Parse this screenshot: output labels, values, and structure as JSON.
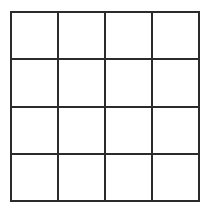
{
  "grid": {
    "rows": 4,
    "columns": 4,
    "line_color": "#2b2b2b",
    "background_color": "#ffffff",
    "cells": [
      [
        "",
        "",
        "",
        ""
      ],
      [
        "",
        "",
        "",
        ""
      ],
      [
        "",
        "",
        "",
        ""
      ],
      [
        "",
        "",
        "",
        ""
      ]
    ]
  }
}
